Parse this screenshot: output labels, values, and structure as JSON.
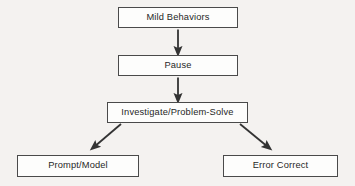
{
  "diagram": {
    "background_color": "#f4f2f0",
    "box_fill_color": "#fdfdfc",
    "box_border_color": "#4a4a4a",
    "text_color": "#272727",
    "arrow_color": "#333333",
    "nodes": [
      {
        "id": "mild-behaviors",
        "label": "Mild Behaviors"
      },
      {
        "id": "pause",
        "label": "Pause"
      },
      {
        "id": "investigate",
        "label": "Investigate/Problem-Solve"
      },
      {
        "id": "prompt-model",
        "label": "Prompt/Model"
      },
      {
        "id": "error-correct",
        "label": "Error Correct"
      }
    ],
    "connectors": [
      {
        "id": "mild-to-pause",
        "from": "mild-behaviors",
        "to": "pause",
        "style": "straight-down-arrow"
      },
      {
        "id": "pause-to-investigate",
        "from": "pause",
        "to": "investigate",
        "style": "straight-down-arrow"
      },
      {
        "id": "investigate-to-prompt-model",
        "from": "investigate",
        "to": "prompt-model",
        "style": "diagonal-down-left-arrow"
      },
      {
        "id": "investigate-to-error-correct",
        "from": "investigate",
        "to": "error-correct",
        "style": "diagonal-down-right-arrow"
      }
    ]
  }
}
